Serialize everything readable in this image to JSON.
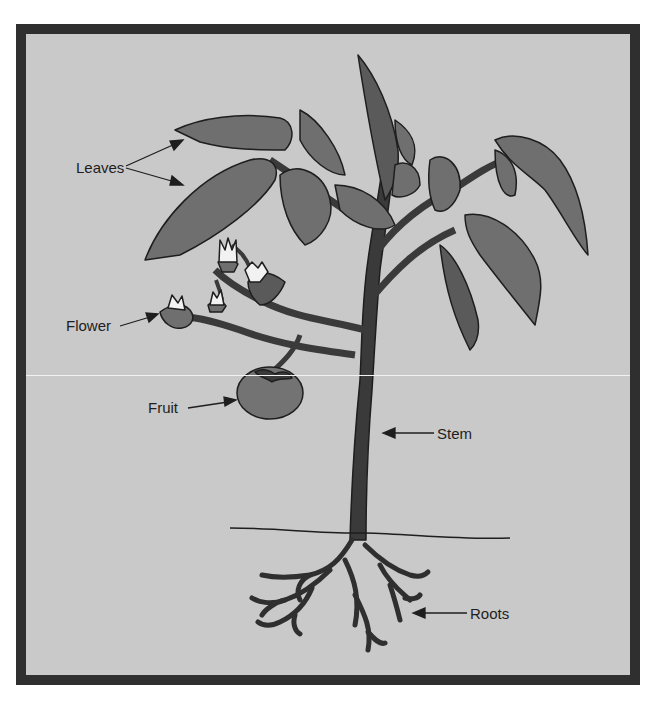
{
  "diagram": {
    "labels": {
      "leaves": "Leaves",
      "flower": "Flower",
      "fruit": "Fruit",
      "stem": "Stem",
      "roots": "Roots"
    },
    "colors": {
      "background": "#c9c9c9",
      "frame": "#2f2f2f",
      "leaf_fill": "#6f6f6f",
      "leaf_dark": "#555555",
      "stem": "#3a3a3a",
      "fruit": "#737373",
      "petal": "#f2f2f2",
      "text": "#1e1e1e"
    }
  }
}
